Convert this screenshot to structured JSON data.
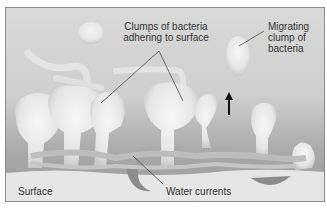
{
  "diagram": {
    "type": "biofilm illustration",
    "labels": {
      "clumps": [
        "Clumps of bacteria",
        "adhering to surface"
      ],
      "migrating": [
        "Migrating",
        "clump of",
        "bacteria"
      ],
      "surface": "Surface",
      "water": "Water currents"
    },
    "colors": {
      "background_top": "#d9d9d9",
      "background_bottom": "#9a9a9a",
      "bacteria": "#ececec",
      "surface": "#e6e6e6",
      "channel": "#8c8c8c",
      "current": "#bdbdbd",
      "arrow": "#111111",
      "text": "#333333"
    }
  }
}
